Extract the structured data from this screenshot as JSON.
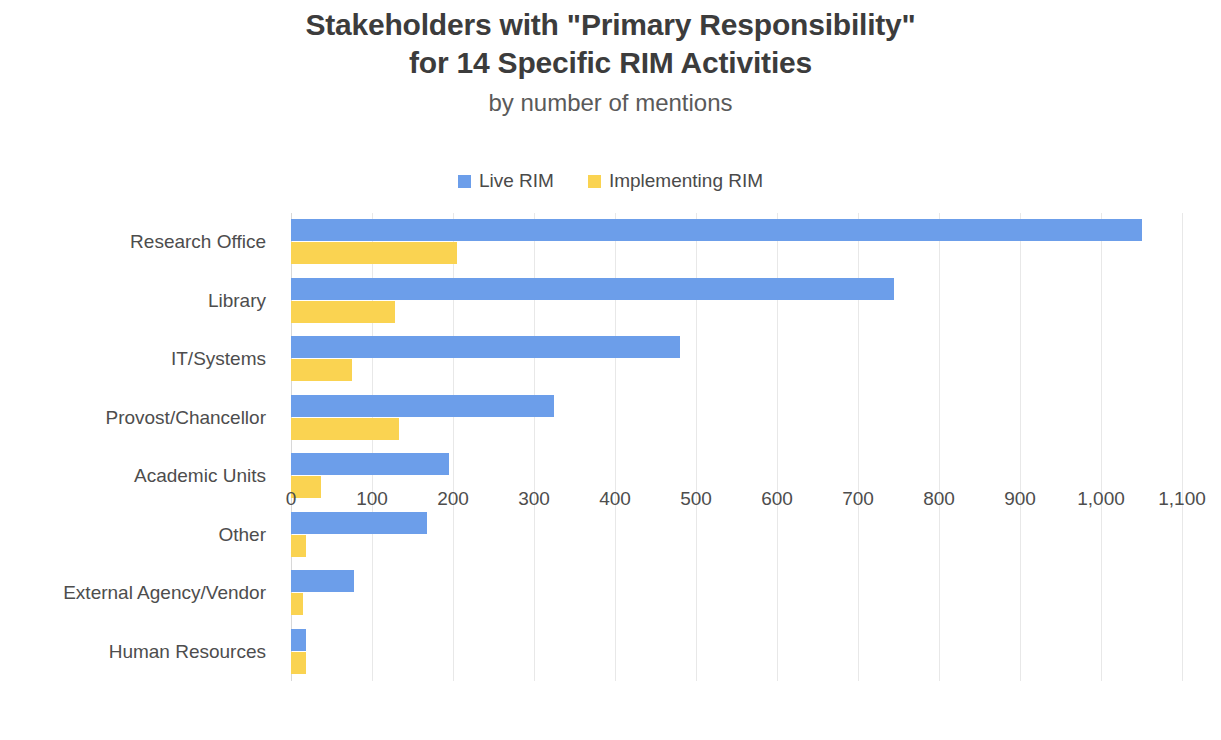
{
  "title": {
    "line1": "Stakeholders with \"Primary Responsibility\"",
    "line2": "for 14 Specific RIM Activities",
    "subtitle": "by number of mentions"
  },
  "legend": {
    "items": [
      {
        "label": "Live RIM",
        "color": "#6c9eea"
      },
      {
        "label": "Implementing RIM",
        "color": "#fad351"
      }
    ]
  },
  "colors": {
    "live_rim": "#6c9eea",
    "implementing_rim": "#fad351",
    "gridline": "#e8e8e8",
    "text": "#4d4d4d",
    "title": "#3c3c3c"
  },
  "chart_data": {
    "type": "bar",
    "orientation": "horizontal",
    "title": "Stakeholders with \"Primary Responsibility\" for 14 Specific RIM Activities",
    "subtitle": "by number of mentions",
    "xlabel": "",
    "ylabel": "",
    "xlim": [
      0,
      1100
    ],
    "xticks": [
      0,
      100,
      200,
      300,
      400,
      500,
      600,
      700,
      800,
      900,
      1000,
      1100
    ],
    "xtick_labels": [
      "0",
      "100",
      "200",
      "300",
      "400",
      "500",
      "600",
      "700",
      "800",
      "900",
      "1,000",
      "1,100"
    ],
    "grid": true,
    "legend_position": "top-center",
    "categories": [
      "Research Office",
      "Library",
      "IT/Systems",
      "Provost/Chancellor",
      "Academic Units",
      "Other",
      "External Agency/Vendor",
      "Human Resources"
    ],
    "series": [
      {
        "name": "Live RIM",
        "color": "#6c9eea",
        "values": [
          1050,
          745,
          480,
          325,
          195,
          168,
          78,
          19
        ]
      },
      {
        "name": "Implementing RIM",
        "color": "#fad351",
        "values": [
          205,
          128,
          75,
          133,
          37,
          18,
          15,
          19
        ]
      }
    ]
  }
}
